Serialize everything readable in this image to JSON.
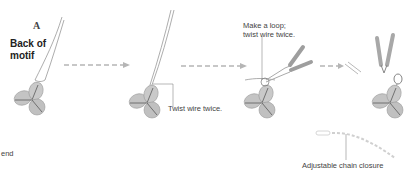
{
  "diagram": {
    "step_letter": "A",
    "title_line1": "Back of",
    "title_line2": "motif",
    "labels": {
      "twist": "Twist wire twice.",
      "loop_line1": "Make a loop;",
      "loop_line2": "twist wire twice.",
      "chain": "Adjustable chain closure",
      "end": "end"
    },
    "colors": {
      "leaf_fill": "#bdbdbd",
      "leaf_vein": "#555555",
      "wire": "#8a8a8a",
      "arrow": "#b5b5b5",
      "tool": "#9e9e9e",
      "leader": "#888888"
    },
    "steps": [
      {
        "id": "step-1",
        "desc": "motif back with wire"
      },
      {
        "id": "step-2",
        "desc": "wire twisted twice"
      },
      {
        "id": "step-3",
        "desc": "loop made with pliers"
      },
      {
        "id": "step-4",
        "desc": "wire cut with nippers"
      }
    ]
  }
}
